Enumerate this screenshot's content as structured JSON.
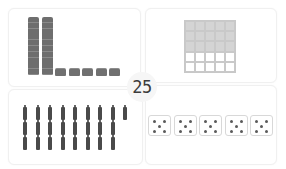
{
  "title_number": "25",
  "representations": {
    "base_ten_blocks": {
      "tens": 2,
      "ones": 5
    },
    "hundred_grid": {
      "columns": 5,
      "rows": 5,
      "shaded_rows": 3,
      "shaded_cells": 15,
      "unshaded_cells": 10
    },
    "sticks": {
      "rows": [
        9,
        8,
        8
      ],
      "total": 25
    },
    "dice": {
      "count": 5,
      "pips_each": 5,
      "total": 25
    }
  },
  "colors": {
    "block": "#707070",
    "grid_shade": "#d4d4d4",
    "stick": "#4a4a4a",
    "pip": "#5a5a5a",
    "number": "#3c3c3c"
  }
}
